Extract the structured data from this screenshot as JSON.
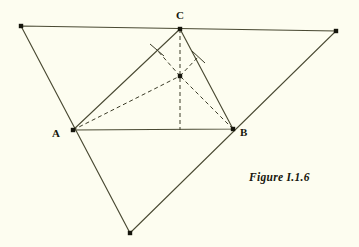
{
  "figure": {
    "caption": "Figure I.1.6",
    "background_color": "#fdfdf0",
    "line_color": "#3c3c28",
    "label_color": "#17170d",
    "width": 359,
    "height": 247
  },
  "labels": {
    "A": "A",
    "B": "B",
    "C": "C"
  },
  "geometry": {
    "outer_triangle": {
      "name": "outer-triangle",
      "stroke": "#4a4a33",
      "stroke_width": 1.1,
      "style": "solid",
      "points": [
        {
          "name": "outer-top-left",
          "x": 21,
          "y": 26
        },
        {
          "name": "outer-top-right",
          "x": 336,
          "y": 31
        },
        {
          "name": "outer-bottom",
          "x": 130,
          "y": 233
        }
      ]
    },
    "inner_triangle": {
      "name": "inner-triangle-abc",
      "stroke": "#4a4a33",
      "stroke_width": 1.1,
      "style": "solid",
      "points": [
        {
          "name": "vertex-a",
          "x": 73,
          "y": 130
        },
        {
          "name": "vertex-b",
          "x": 233,
          "y": 129
        },
        {
          "name": "vertex-c",
          "x": 180,
          "y": 29
        }
      ]
    },
    "center_point": {
      "name": "circumcenter-point",
      "x": 180,
      "y": 76
    },
    "altitude_foot_ab": {
      "name": "foot-on-ab",
      "x": 180,
      "y": 130
    },
    "perp_foot_ca": {
      "name": "foot-on-ca",
      "x": 157,
      "y": 50
    },
    "perp_foot_cb": {
      "name": "foot-on-cb",
      "x": 198,
      "y": 57
    },
    "dashed_segments": [
      {
        "name": "dash-c-to-foot-ab",
        "x1": 180,
        "y1": 29,
        "x2": 180,
        "y2": 130
      },
      {
        "name": "dash-a-to-center",
        "x1": 73,
        "y1": 130,
        "x2": 180,
        "y2": 76
      },
      {
        "name": "dash-b-to-center",
        "x1": 233,
        "y1": 129,
        "x2": 180,
        "y2": 76
      },
      {
        "name": "dash-center-to-foot-ca",
        "x1": 180,
        "y1": 76,
        "x2": 157,
        "y2": 50
      },
      {
        "name": "dash-center-to-foot-cb",
        "x1": 180,
        "y1": 76,
        "x2": 198,
        "y2": 57
      }
    ],
    "tick_marks": [
      {
        "name": "tick-on-ca",
        "x1": 150,
        "y1": 44,
        "x2": 164,
        "y2": 56
      },
      {
        "name": "tick-on-cb",
        "x1": 192,
        "y1": 51,
        "x2": 205,
        "y2": 63
      }
    ],
    "node_dots": [
      {
        "name": "dot-outer-top-left",
        "x": 21,
        "y": 26
      },
      {
        "name": "dot-outer-top-right",
        "x": 336,
        "y": 31
      },
      {
        "name": "dot-outer-bottom",
        "x": 130,
        "y": 233
      },
      {
        "name": "dot-vertex-a",
        "x": 73,
        "y": 130
      },
      {
        "name": "dot-vertex-b",
        "x": 233,
        "y": 129
      },
      {
        "name": "dot-vertex-c",
        "x": 180,
        "y": 29
      },
      {
        "name": "dot-center",
        "x": 180,
        "y": 76
      }
    ]
  }
}
